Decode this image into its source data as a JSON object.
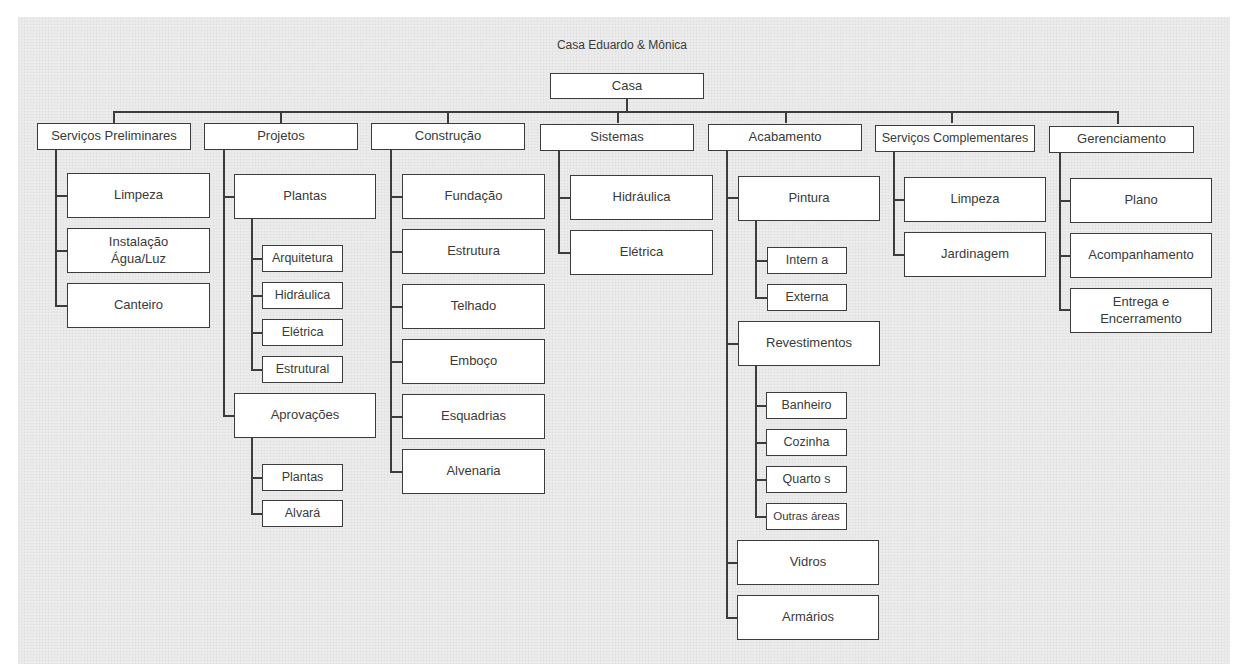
{
  "title": "Casa Eduardo & Mônica",
  "colors": {
    "background": "#ececec",
    "box_fill": "#ffffff",
    "line": "#3c3c3c",
    "text": "#3a3a3a"
  },
  "root": {
    "label": "Casa"
  },
  "categories": [
    {
      "label": "Serviços Preliminares",
      "children": [
        {
          "label": "Limpeza"
        },
        {
          "label": "Instalação\nÁgua/Luz"
        },
        {
          "label": "Canteiro"
        }
      ]
    },
    {
      "label": "Projetos",
      "children": [
        {
          "label": "Plantas",
          "children": [
            {
              "label": "Arquitetura"
            },
            {
              "label": "Hidráulica"
            },
            {
              "label": "Elétrica"
            },
            {
              "label": "Estrutural"
            }
          ]
        },
        {
          "label": "Aprovações",
          "children": [
            {
              "label": "Plantas"
            },
            {
              "label": "Alvará"
            }
          ]
        }
      ]
    },
    {
      "label": "Construção",
      "children": [
        {
          "label": "Fundação"
        },
        {
          "label": "Estrutura"
        },
        {
          "label": "Telhado"
        },
        {
          "label": "Emboço"
        },
        {
          "label": "Esquadrias"
        },
        {
          "label": "Alvenaria"
        }
      ]
    },
    {
      "label": "Sistemas",
      "children": [
        {
          "label": "Hidráulica"
        },
        {
          "label": "Elétrica"
        }
      ]
    },
    {
      "label": "Acabamento",
      "children": [
        {
          "label": "Pintura",
          "children": [
            {
              "label": "Intern a"
            },
            {
              "label": "Externa"
            }
          ]
        },
        {
          "label": "Revestimentos",
          "children": [
            {
              "label": "Banheiro"
            },
            {
              "label": "Cozinha"
            },
            {
              "label": "Quarto s"
            },
            {
              "label": "Outras áreas"
            }
          ]
        },
        {
          "label": "Vidros"
        },
        {
          "label": "Armários"
        }
      ]
    },
    {
      "label": "Serviços Complementares",
      "children": [
        {
          "label": "Limpeza"
        },
        {
          "label": "Jardinagem"
        }
      ]
    },
    {
      "label": "Gerenciamento",
      "children": [
        {
          "label": "Plano"
        },
        {
          "label": "Acompanhamento"
        },
        {
          "label": "Entrega e\nEncerramento"
        }
      ]
    }
  ]
}
